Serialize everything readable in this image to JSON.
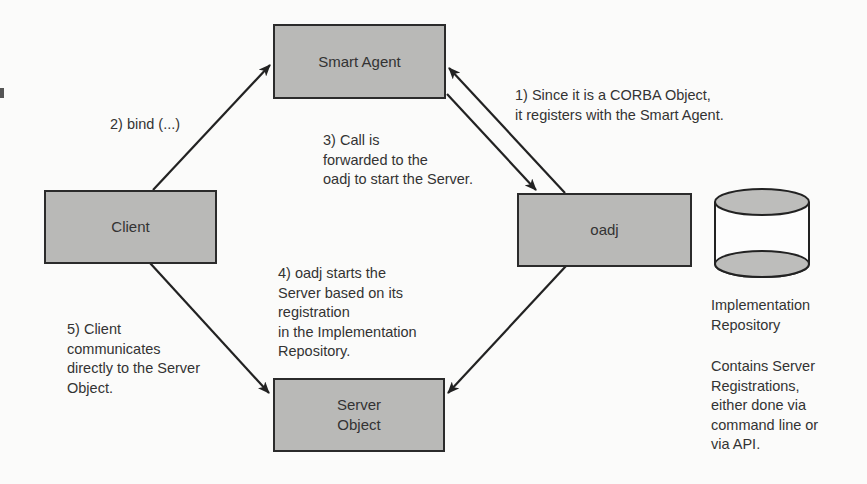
{
  "diagram": {
    "nodes": {
      "smart_agent": "Smart Agent",
      "client": "Client",
      "oadj": "oadj",
      "server_object": "Server\nObject",
      "repository": "Implementation\nRepository"
    },
    "steps": {
      "step1": "1) Since it is a CORBA Object,\nit registers with the Smart Agent.",
      "step2": "2) bind (...)",
      "step3": "3) Call is\nforwarded to the\noadj to start the Server.",
      "step4": "4) oadj starts the\nServer based on its\nregistration\nin the Implementation\nRepository.",
      "step5": "5) Client\ncommunicates\ndirectly to the Server\nObject."
    },
    "repository_note": "Contains Server\nRegistrations,\neither done via\ncommand line or\nvia API.",
    "edges": [
      {
        "from": "client",
        "to": "smart_agent",
        "label": "step2"
      },
      {
        "from": "oadj",
        "to": "smart_agent",
        "label": "step1"
      },
      {
        "from": "smart_agent",
        "to": "oadj",
        "label": "step3"
      },
      {
        "from": "oadj",
        "to": "server_object",
        "label": "step4"
      },
      {
        "from": "client",
        "to": "server_object",
        "label": "step5"
      }
    ],
    "colors": {
      "box_fill": "#b9b9b7",
      "stroke": "#2b2b2b",
      "background": "#fbfbfa"
    }
  }
}
